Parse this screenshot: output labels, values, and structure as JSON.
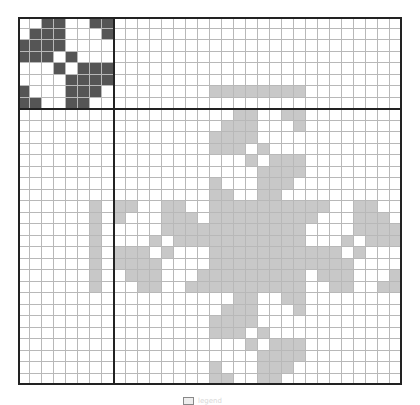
{
  "figure": {
    "rows": 32,
    "cols": 32,
    "block_size": 8,
    "colors": {
      "dark": "#555555",
      "light": "#c8c8c8",
      "empty": "#ffffff",
      "grid": "#b8b8b8",
      "frame": "#222222"
    },
    "seed_matrix_A": [
      [
        2,
        3,
        6,
        7
      ],
      [
        1,
        2,
        3,
        7
      ],
      [
        0,
        1,
        2,
        3
      ],
      [
        0,
        1,
        2,
        4
      ],
      [
        3,
        5,
        6,
        7
      ],
      [
        4,
        5,
        6,
        7
      ],
      [
        0,
        4,
        5,
        6
      ],
      [
        0,
        1,
        4,
        5
      ]
    ],
    "dark_blocks": [
      {
        "row0": 0,
        "col0": 0,
        "pattern": "A"
      }
    ],
    "light_blocks": [
      {
        "row0": 8,
        "col0": 16,
        "pattern": "A"
      },
      {
        "row0": 16,
        "col0": 8,
        "pattern": "flipud_A"
      },
      {
        "row0": 16,
        "col0": 16,
        "pattern": "full"
      },
      {
        "row0": 16,
        "col0": 24,
        "pattern": "flipud_A"
      },
      {
        "row0": 24,
        "col0": 16,
        "pattern": "A"
      }
    ],
    "light_row_segments": [
      {
        "row": 6,
        "col_start": 16,
        "col_end": 23
      }
    ],
    "light_col_segments": [
      {
        "col": 6,
        "row_start": 16,
        "row_end": 23
      }
    ],
    "divider_after_row": 8,
    "divider_after_col": 8
  },
  "legend": {
    "icon": "box-icon",
    "label": "legend"
  }
}
